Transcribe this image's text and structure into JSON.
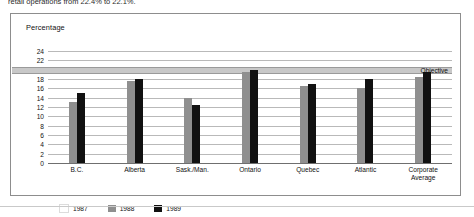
{
  "caption": {
    "text": "retail operations from 22.4% to 22.1%."
  },
  "chart_data": {
    "type": "bar",
    "title": "",
    "ylabel": "Percentage",
    "xlabel": "",
    "ylim": [
      0,
      24
    ],
    "ytick_step": 2,
    "yticks": [
      0,
      2,
      4,
      6,
      8,
      10,
      12,
      14,
      16,
      18,
      20,
      22,
      24
    ],
    "grid": true,
    "legend_position": "bottom-left",
    "categories": [
      "B.C.",
      "Alberta",
      "Sask./Man.",
      "Ontario",
      "Quebec",
      "Atlantic",
      "Corporate Average"
    ],
    "series": [
      {
        "name": "1987",
        "color": "#ffffff",
        "values": [
          null,
          null,
          null,
          null,
          null,
          null,
          null
        ]
      },
      {
        "name": "1988",
        "color": "#8f8f8f",
        "values": [
          13.0,
          17.5,
          14.0,
          19.5,
          16.5,
          16.0,
          18.5
        ]
      },
      {
        "name": "1989",
        "color": "#111111",
        "values": [
          15.0,
          18.0,
          12.5,
          20.0,
          17.0,
          18.0,
          19.5
        ]
      }
    ],
    "annotations": [
      {
        "name": "objective",
        "label": "Objective",
        "value": 20
      }
    ]
  },
  "legend": {
    "items": [
      {
        "label": "1987",
        "swatch": "y1987"
      },
      {
        "label": "1988",
        "swatch": "y1988"
      },
      {
        "label": "1989",
        "swatch": "y1989"
      }
    ]
  }
}
